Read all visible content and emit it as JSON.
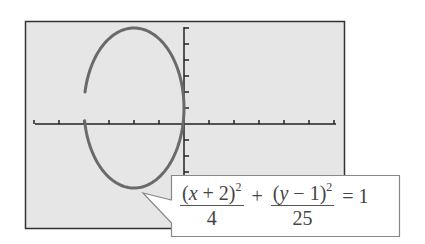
{
  "chart_data": {
    "type": "line",
    "title": "",
    "xlabel": "",
    "ylabel": "",
    "equation": "(x + 2)^2/4 + (y - 1)^2/25 = 1",
    "curve": "ellipse",
    "center": [
      -2,
      1
    ],
    "semi_axis_x": 2,
    "semi_axis_y": 5,
    "xlim": [
      -6,
      6
    ],
    "ylim": [
      -6,
      6
    ],
    "x_ticks": [
      -6,
      -5,
      -4,
      -3,
      -2,
      -1,
      0,
      1,
      2,
      3,
      4,
      5,
      6
    ],
    "y_ticks": [
      -3,
      -2,
      -1,
      0,
      1,
      2,
      3,
      4,
      5,
      6
    ],
    "tick_labels_shown": false,
    "grid": false,
    "legend": null,
    "series": [
      {
        "name": "ellipse",
        "points": [
          [
            -4,
            2
          ],
          [
            -3.6,
            4
          ],
          [
            -2,
            6
          ],
          [
            -0.4,
            4
          ],
          [
            0,
            1
          ],
          [
            -0.4,
            -2
          ],
          [
            -2,
            -4
          ],
          [
            -3.6,
            -2
          ],
          [
            -4,
            0
          ]
        ]
      }
    ],
    "gap_in_curve": {
      "x": -4,
      "y_from": 0.2,
      "y_to": 2
    }
  },
  "callout": {
    "frac1_num_open": "(",
    "frac1_var": "x",
    "frac1_num_rest": " + 2)",
    "frac1_exp": "2",
    "frac1_den": "4",
    "plus": "+",
    "frac2_num_open": "(",
    "frac2_var": "y",
    "frac2_num_rest": " − 1)",
    "frac2_exp": "2",
    "frac2_den": "25",
    "equals": "= 1"
  },
  "colors": {
    "screen_bg": "#e6e6e6",
    "frame": "#333333",
    "axis": "#222222",
    "curve": "#6a6a6a",
    "callout_bg": "#ffffff",
    "callout_border": "#888888"
  }
}
